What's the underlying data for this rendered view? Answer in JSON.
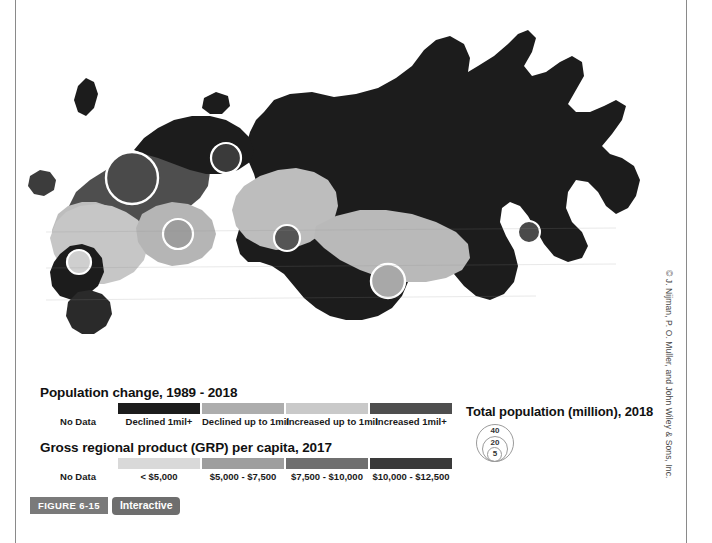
{
  "figure": {
    "figure_badge": "FIGURE 6-15",
    "interactive_badge": "Interactive",
    "copyright": "© J. Nijman, P. O. Muller, and John Wiley & Sons, Inc."
  },
  "legends": {
    "population_change": {
      "title": "Population change, 1989 - 2018",
      "classes": [
        {
          "label": "No Data",
          "color": "#ffffff"
        },
        {
          "label": "Declined 1mil+",
          "color": "#1c1c1c"
        },
        {
          "label": "Declined up to 1mil",
          "color": "#adadad"
        },
        {
          "label": "Increased up to 1mil",
          "color": "#c9c9c9"
        },
        {
          "label": "Increased 1mil+",
          "color": "#4e4e4e"
        }
      ]
    },
    "grp_per_capita": {
      "title": "Gross regional product (GRP) per capita, 2017",
      "classes": [
        {
          "label": "No Data",
          "color": "#ffffff"
        },
        {
          "label": "< $5,000",
          "color": "#d9d9d9"
        },
        {
          "label": "$5,000 - $7,500",
          "color": "#9e9e9e"
        },
        {
          "label": "$7,500 - $10,000",
          "color": "#6f6f6f"
        },
        {
          "label": "$10,000 - $12,500",
          "color": "#3a3a3a"
        }
      ]
    },
    "total_population": {
      "title": "Total population (million), 2018",
      "sizes": [
        {
          "label": "40",
          "diameter_px": 38
        },
        {
          "label": "20",
          "diameter_px": 26
        },
        {
          "label": "5",
          "diameter_px": 15
        }
      ]
    }
  },
  "map": {
    "name": "russia-choropleth-map",
    "ocean_color": "#ffffff",
    "border_color": "#5a5a5a",
    "bubble_stroke": "#ffffff",
    "regions": [
      {
        "id": "kaliningrad",
        "fill": "#3c3c3c"
      },
      {
        "id": "northwest-light",
        "fill": "#bdbdbd"
      },
      {
        "id": "central-west",
        "fill": "#c6c6c6"
      },
      {
        "id": "north-european",
        "fill": "#4e4e4e"
      },
      {
        "id": "karelia-kola",
        "fill": "#1c1c1c"
      },
      {
        "id": "volga-dark",
        "fill": "#1c1c1c"
      },
      {
        "id": "urals-light",
        "fill": "#b5b5b5"
      },
      {
        "id": "west-siberia-light",
        "fill": "#bdbdbd"
      },
      {
        "id": "siberia-dark",
        "fill": "#1c1c1c"
      },
      {
        "id": "south-siberia-grey",
        "fill": "#b9b9b9"
      },
      {
        "id": "far-east-dark",
        "fill": "#1c1c1c"
      },
      {
        "id": "caucasus-dark",
        "fill": "#2a2a2a"
      }
    ],
    "bubbles": [
      {
        "id": "moscow",
        "cx": 116,
        "cy": 178,
        "r": 26,
        "fill": "#4a4a4a"
      },
      {
        "id": "st-petersburg",
        "cx": 210,
        "cy": 158,
        "r": 15,
        "fill": "#3a3a3a"
      },
      {
        "id": "urals",
        "cx": 162,
        "cy": 234,
        "r": 15,
        "fill": "#9d9d9d"
      },
      {
        "id": "volga-small",
        "cx": 63,
        "cy": 262,
        "r": 12,
        "fill": "#cfcfcf"
      },
      {
        "id": "krasnoyarsk",
        "cx": 271,
        "cy": 238,
        "r": 13,
        "fill": "#555555"
      },
      {
        "id": "novosibirsk",
        "cx": 372,
        "cy": 281,
        "r": 17,
        "fill": "#a8a8a8"
      },
      {
        "id": "far-east",
        "cx": 513,
        "cy": 232,
        "r": 11,
        "fill": "#4a4a4a"
      }
    ]
  }
}
